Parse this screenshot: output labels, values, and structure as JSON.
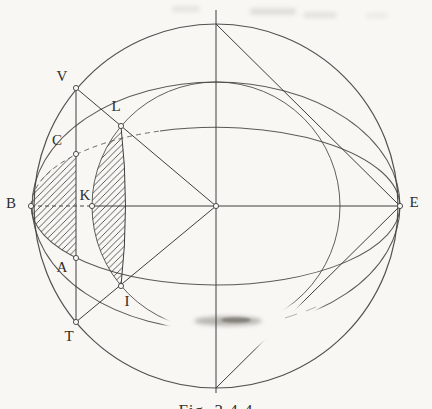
{
  "figure": {
    "caption": "Fig. 3.4.4",
    "colors": {
      "ink": "#3f3e3c",
      "paper": "#f8f7f4",
      "hatch": "#4a4947",
      "smudge": "#6e6a63"
    },
    "points": [
      {
        "label": "V",
        "x": 76,
        "y": 88,
        "lx": 62,
        "ly": 78
      },
      {
        "label": "L",
        "x": 121,
        "y": 126,
        "lx": 116,
        "ly": 108
      },
      {
        "label": "C",
        "x": 76,
        "y": 154,
        "lx": 57,
        "ly": 142
      },
      {
        "label": "B",
        "x": 31,
        "y": 206,
        "lx": 11,
        "ly": 205
      },
      {
        "label": "K",
        "x": 92,
        "y": 206,
        "lx": 85,
        "ly": 197
      },
      {
        "label": "A",
        "x": 76,
        "y": 258,
        "lx": 62,
        "ly": 269
      },
      {
        "label": "I",
        "x": 121,
        "y": 286,
        "lx": 127,
        "ly": 303
      },
      {
        "label": "T",
        "x": 76,
        "y": 322,
        "lx": 69,
        "ly": 338
      },
      {
        "label": "E",
        "x": 400,
        "y": 206,
        "lx": 414,
        "ly": 204
      },
      {
        "label": "",
        "x": 216,
        "y": 206,
        "lx": 0,
        "ly": 0
      }
    ]
  }
}
